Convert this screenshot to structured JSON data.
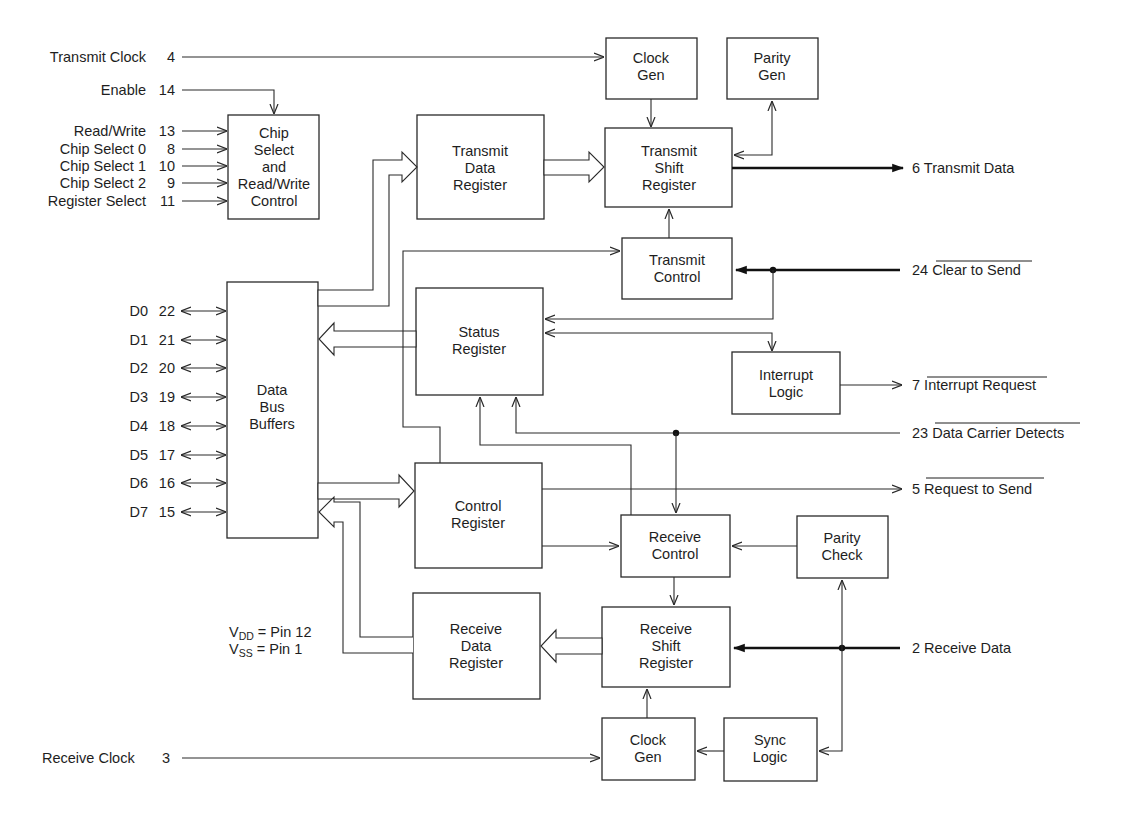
{
  "blocks": {
    "clock_gen_tx": {
      "lines": [
        "Clock",
        "Gen"
      ]
    },
    "parity_gen": {
      "lines": [
        "Parity",
        "Gen"
      ]
    },
    "chip_select": {
      "lines": [
        "Chip",
        "Select",
        "and",
        "Read/Write",
        "Control"
      ]
    },
    "transmit_data_register": {
      "lines": [
        "Transmit",
        "Data",
        "Register"
      ]
    },
    "transmit_shift_register": {
      "lines": [
        "Transmit",
        "Shift",
        "Register"
      ]
    },
    "transmit_control": {
      "lines": [
        "Transmit",
        "Control"
      ]
    },
    "data_bus_buffers": {
      "lines": [
        "Data",
        "Bus",
        "Buffers"
      ]
    },
    "status_register": {
      "lines": [
        "Status",
        "Register"
      ]
    },
    "interrupt_logic": {
      "lines": [
        "Interrupt",
        "Logic"
      ]
    },
    "control_register": {
      "lines": [
        "Control",
        "Register"
      ]
    },
    "receive_control": {
      "lines": [
        "Receive",
        "Control"
      ]
    },
    "parity_check": {
      "lines": [
        "Parity",
        "Check"
      ]
    },
    "receive_data_register": {
      "lines": [
        "Receive",
        "Data",
        "Register"
      ]
    },
    "receive_shift_register": {
      "lines": [
        "Receive",
        "Shift",
        "Register"
      ]
    },
    "clock_gen_rx": {
      "lines": [
        "Clock",
        "Gen"
      ]
    },
    "sync_logic": {
      "lines": [
        "Sync",
        "Logic"
      ]
    }
  },
  "left_pins": {
    "transmit_clock": {
      "name": "Transmit Clock",
      "pin": "4"
    },
    "enable": {
      "name": "Enable",
      "pin": "14"
    },
    "control_inputs": [
      {
        "name": "Read/Write",
        "pin": "13"
      },
      {
        "name": "Chip Select 0",
        "pin": "8"
      },
      {
        "name": "Chip Select 1",
        "pin": "10"
      },
      {
        "name": "Chip Select 2",
        "pin": "9"
      },
      {
        "name": "Register Select",
        "pin": "11"
      }
    ],
    "data_bus": [
      {
        "name": "D0",
        "pin": "22"
      },
      {
        "name": "D1",
        "pin": "21"
      },
      {
        "name": "D2",
        "pin": "20"
      },
      {
        "name": "D3",
        "pin": "19"
      },
      {
        "name": "D4",
        "pin": "18"
      },
      {
        "name": "D5",
        "pin": "17"
      },
      {
        "name": "D6",
        "pin": "16"
      },
      {
        "name": "D7",
        "pin": "15"
      }
    ],
    "receive_clock": {
      "name": "Receive Clock",
      "pin": "3"
    }
  },
  "power": {
    "vdd": {
      "sym": "V",
      "sub": "DD",
      "rest": " = Pin 12"
    },
    "vss": {
      "sym": "V",
      "sub": "SS",
      "rest": " = Pin 1"
    }
  },
  "right_pins": {
    "transmit_data": {
      "pin": "6",
      "name": "Transmit Data",
      "active_low": false
    },
    "clear_to_send": {
      "pin": "24",
      "name": "Clear to Send",
      "active_low": true
    },
    "interrupt_request": {
      "pin": "7",
      "name": "Interrupt Request",
      "active_low": true
    },
    "data_carrier_detect": {
      "pin": "23",
      "name": "Data Carrier Detects",
      "active_low": true
    },
    "request_to_send": {
      "pin": "5",
      "name": "Request to Send",
      "active_low": true
    },
    "receive_data": {
      "pin": "2",
      "name": "Receive Data",
      "active_low": false
    }
  }
}
